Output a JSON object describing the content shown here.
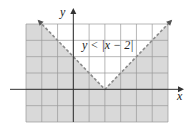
{
  "chart_data": {
    "type": "inequality-region",
    "title": "",
    "inequality": "y < |x − 2|",
    "label_text": "y < |x − 2|",
    "boundary": "y = |x − 2|",
    "boundary_style": "dashed",
    "vertex": [
      2,
      0
    ],
    "shaded_region": "below the V (y < |x − 2|)",
    "xlabel": "x",
    "ylabel": "y",
    "xlim": [
      -3,
      6
    ],
    "ylim": [
      -2,
      4
    ],
    "grid": true,
    "grid_step": 1,
    "colors": {
      "shade": "#d9d9d9",
      "grid": "#9a9a9a",
      "boundary": "#8a8a8a",
      "axes": "#333333"
    }
  },
  "axes": {
    "x_label": "x",
    "y_label": "y"
  },
  "annotation": {
    "text": "y < |x − 2|"
  }
}
